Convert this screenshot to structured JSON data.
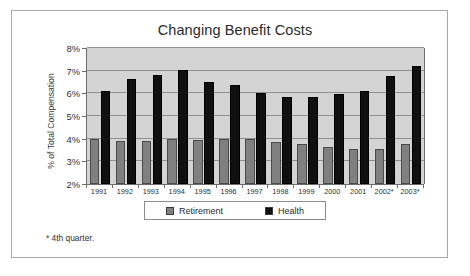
{
  "chart_data": {
    "type": "bar",
    "title": "Changing Benefit Costs",
    "xlabel": "",
    "ylabel": "% of Total Compensation",
    "categories": [
      "1991",
      "1992",
      "1993",
      "1994",
      "1995",
      "1996",
      "1997",
      "1998",
      "1999",
      "2000",
      "2001",
      "2002*",
      "2003*"
    ],
    "series": [
      {
        "name": "Retirement",
        "color": "#808080",
        "values": [
          4.0,
          3.9,
          3.9,
          4.0,
          3.95,
          4.0,
          4.0,
          3.85,
          3.75,
          3.65,
          3.55,
          3.55,
          3.75
        ]
      },
      {
        "name": "Health",
        "color": "#101010",
        "values": [
          6.1,
          6.65,
          6.8,
          7.05,
          6.5,
          6.35,
          6.0,
          5.85,
          5.85,
          5.95,
          6.1,
          6.75,
          7.2
        ]
      }
    ],
    "ylim": [
      2,
      8
    ],
    "yticks": [
      2,
      3,
      4,
      5,
      6,
      7,
      8
    ],
    "ytick_labels": [
      "2%",
      "3%",
      "4%",
      "5%",
      "6%",
      "7%",
      "8%"
    ],
    "grid": true,
    "legend_position": "bottom",
    "plot_background": "#d4d4d4",
    "figure_background": "#ffffff"
  },
  "footnote": {
    "text": "* 4th quarter."
  },
  "legend": {
    "entries": [
      {
        "label": "Retirement",
        "icon": "legend-swatch-retirement"
      },
      {
        "label": "Health",
        "icon": "legend-swatch-health"
      }
    ]
  }
}
